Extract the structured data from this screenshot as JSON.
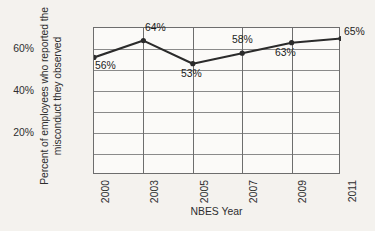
{
  "chart_data": {
    "type": "line",
    "title": "",
    "xlabel": "NBES Year",
    "ylabel_line1": "Percent of employees who reported the",
    "ylabel_line2": "misconduct they observed",
    "categories": [
      "2000",
      "2003",
      "2005",
      "2007",
      "2009",
      "2011"
    ],
    "values": [
      56,
      64,
      53,
      58,
      63,
      65
    ],
    "point_labels": [
      "56%",
      "64%",
      "53%",
      "58%",
      "63%",
      "65%"
    ],
    "ylim": [
      0,
      70
    ],
    "ytick_values": [
      20,
      40,
      60
    ],
    "ytick_labels": [
      "20%",
      "40%",
      "60%"
    ],
    "gridline_values": [
      10,
      20,
      30,
      40,
      50,
      60
    ],
    "grid": true,
    "legend": "none",
    "series_color": "#2b2b2b",
    "grid_color": "#8a8a8a",
    "axis_color": "#6d6d6d",
    "background_color": "#f4f2ee",
    "plot_background_color": "#fbfaf8",
    "marker": "circle"
  }
}
